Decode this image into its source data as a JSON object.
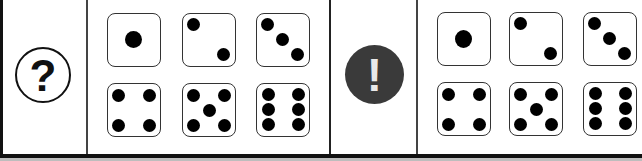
{
  "panels": [
    {
      "symbol": "?",
      "symbol_icon": "question-mark-icon",
      "dice": [
        1,
        2,
        3,
        4,
        5,
        6
      ]
    },
    {
      "symbol": "!",
      "symbol_icon": "exclamation-mark-icon",
      "dice": [
        1,
        2,
        3,
        4,
        5,
        6
      ]
    }
  ],
  "colors": {
    "pip": "#000000",
    "border": "#333333",
    "exclamation_bg": "#3a3a3a"
  }
}
